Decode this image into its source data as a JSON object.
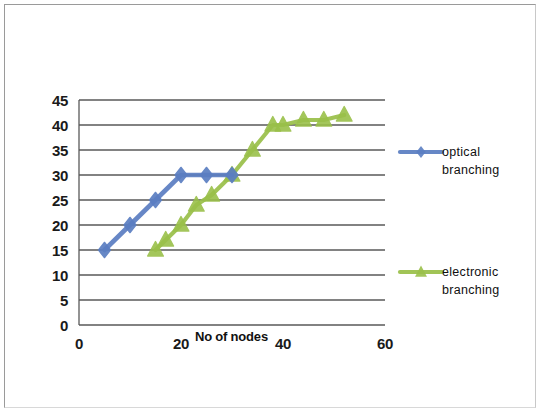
{
  "chart_data": {
    "type": "line",
    "title": "",
    "xlabel": "No of nodes",
    "ylabel": "",
    "xlim": [
      0,
      60
    ],
    "ylim": [
      0,
      45
    ],
    "xticks": [
      "0",
      "20",
      "40",
      "60"
    ],
    "xtick_values": [
      0,
      20,
      40,
      60
    ],
    "yticks": [
      "0",
      "5",
      "10",
      "15",
      "20",
      "25",
      "30",
      "35",
      "40",
      "45"
    ],
    "ytick_values": [
      0,
      5,
      10,
      15,
      20,
      25,
      30,
      35,
      40,
      45
    ],
    "grid": "horizontal",
    "legend_position": "right",
    "series": [
      {
        "name": "optical branching",
        "color": "#5b7ec2",
        "marker": "diamond",
        "x": [
          5,
          10,
          15,
          20,
          25,
          30
        ],
        "y": [
          15,
          20,
          25,
          30,
          30,
          30
        ]
      },
      {
        "name": "electronic branching",
        "color": "#9ac04a",
        "marker": "triangle",
        "x": [
          15,
          17,
          20,
          23,
          26,
          30,
          34,
          38,
          40,
          44,
          48,
          52
        ],
        "y": [
          15,
          17,
          20,
          24,
          26,
          30,
          35,
          40,
          40,
          41,
          41,
          42
        ]
      }
    ]
  },
  "legend": {
    "items": [
      {
        "label_line1": "optical",
        "label_line2": "branching",
        "color": "#5b7ec2"
      },
      {
        "label_line1": "electronic",
        "label_line2": "branching",
        "color": "#9ac04a"
      }
    ]
  },
  "axis": {
    "x_title": "No of nodes"
  },
  "colors": {
    "optical": "#5b7ec2",
    "electronic": "#9ac04a",
    "gridline": "#595959",
    "frame": "#9a9a9a",
    "background": "#ffffff"
  }
}
